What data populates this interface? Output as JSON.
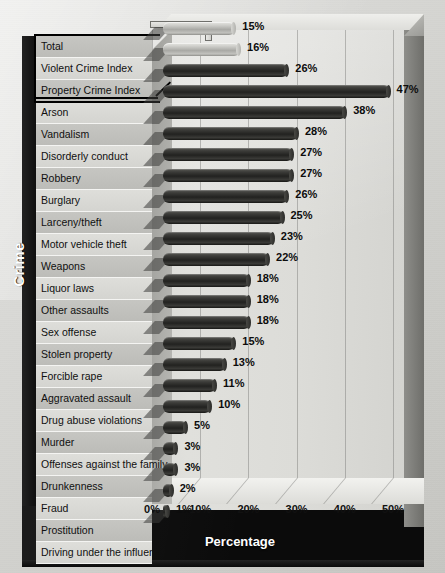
{
  "chart_data": {
    "type": "bar",
    "orientation": "horizontal",
    "title": "",
    "xlabel": "Percentage",
    "ylabel": "Crime",
    "xlim": [
      0,
      56
    ],
    "xticks": [
      "0%",
      "10%",
      "20%",
      "30%",
      "40%",
      "50%"
    ],
    "xtick_values": [
      0,
      10,
      20,
      30,
      40,
      50
    ],
    "grid": "vertical",
    "legend": "none",
    "value_suffix": "%",
    "categories": [
      "Total",
      "Violent Crime Index",
      "Property Crime Index",
      "Arson",
      "Vandalism",
      "Disorderly conduct",
      "Robbery",
      "Burglary",
      "Larceny/theft",
      "Motor vehicle theft",
      "Weapons",
      "Liquor laws",
      "Other assaults",
      "Sex offense",
      "Stolen property",
      "Forcible rape",
      "Aggravated assault",
      "Drug abuse violations",
      "Murder",
      "Offenses against the family",
      "Drunkenness",
      "Fraud",
      "Prostitution",
      "Driving under the influence"
    ],
    "values": [
      15,
      16,
      26,
      47,
      38,
      28,
      27,
      27,
      26,
      25,
      23,
      22,
      18,
      18,
      18,
      15,
      13,
      11,
      10,
      5,
      3,
      3,
      2,
      1
    ],
    "value_labels": [
      "15%",
      "16%",
      "26%",
      "47%",
      "38%",
      "28%",
      "27%",
      "27%",
      "26%",
      "25%",
      "23%",
      "22%",
      "18%",
      "18%",
      "18%",
      "15%",
      "13%",
      "11%",
      "10%",
      "5%",
      "3%",
      "3%",
      "2%",
      "1%"
    ],
    "series_styles": [
      "light",
      "light",
      "dark",
      "dark",
      "dark",
      "dark",
      "dark",
      "dark",
      "dark",
      "dark",
      "dark",
      "dark",
      "dark",
      "dark",
      "dark",
      "dark",
      "dark",
      "dark",
      "dark",
      "dark",
      "dark",
      "dark",
      "dark",
      "dark"
    ],
    "colors": {
      "bar_dark": "#242422",
      "bar_light": "#bdbdb9",
      "background": "#d6d6d2",
      "panel": "#0b0b0b",
      "label_band_odd": "#c6c6c2",
      "label_band_even": "#dedeca",
      "axis_text": "#111111",
      "title_text": "#ffffff"
    },
    "highlighted_categories": [
      "Total",
      "Violent Crime Index",
      "Property Crime Index"
    ]
  }
}
